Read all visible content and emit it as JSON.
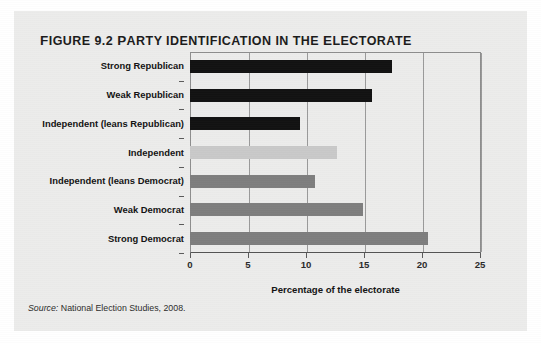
{
  "figure": {
    "number_label": "Figure 9.2",
    "title": "Party Identification in the Electorate",
    "source": "Source: National Election Studies, 2008.",
    "source_word": "Source:",
    "source_rest": " National Election Studies, 2008."
  },
  "colors": {
    "panel_background": "#ececeb",
    "republican_bar": "#121212",
    "independent_bar": "#c9c9c9",
    "democrat_bar": "#7e7e7e",
    "frame": "#8e8e8e",
    "gridline": "#9a9a9a",
    "text": "#121212"
  },
  "chart_data": {
    "type": "bar",
    "orientation": "horizontal",
    "title": "Figure 9.2 Party Identification in the Electorate",
    "xlabel": "Percentage of the electorate",
    "ylabel": "",
    "xlim": [
      0,
      25
    ],
    "xticks": [
      0,
      5,
      10,
      15,
      20,
      25
    ],
    "xtick_labels": [
      "0",
      "5",
      "10",
      "15",
      "20",
      "25"
    ],
    "grid": true,
    "legend": "none",
    "categories": [
      "Strong Republican",
      "Weak Republican",
      "Independent (leans Republican)",
      "Independent",
      "Independent (leans Democrat)",
      "Weak Democrat",
      "Strong Democrat"
    ],
    "values": [
      17.4,
      15.7,
      9.5,
      12.7,
      10.8,
      14.9,
      20.5
    ],
    "bar_colors": [
      "#121212",
      "#121212",
      "#121212",
      "#c9c9c9",
      "#7e7e7e",
      "#7e7e7e",
      "#7e7e7e"
    ],
    "source": "National Election Studies, 2008."
  }
}
